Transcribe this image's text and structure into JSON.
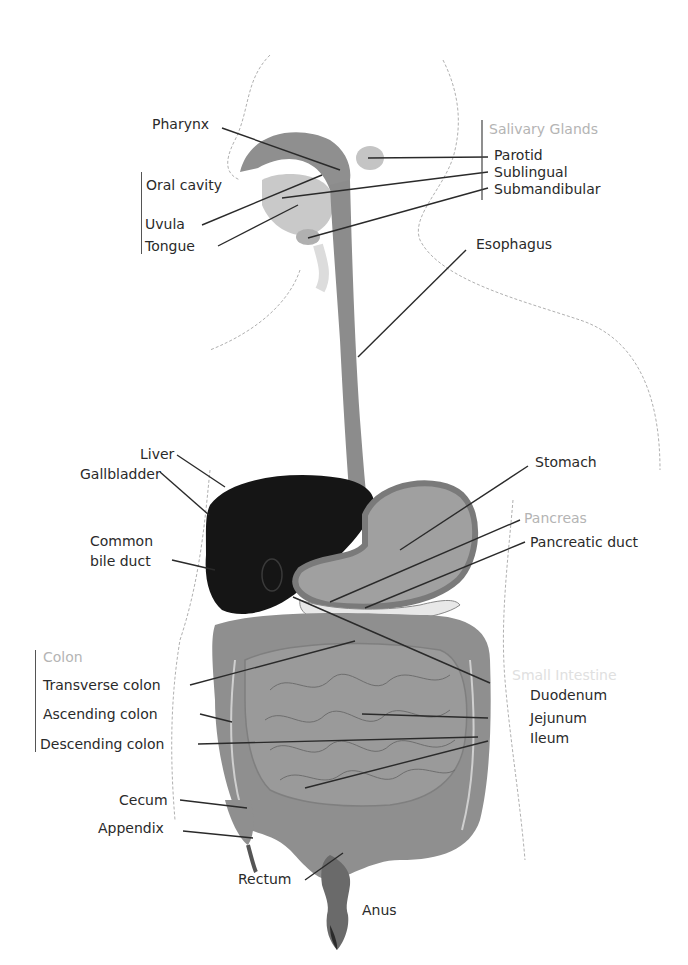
{
  "colors": {
    "organ_gray": "#8f8f8f",
    "organ_light": "#bdbdbd",
    "liver": "#141414",
    "outline": "#aaaaaa",
    "leader": "#2a2a2a",
    "label": "#2a2a2a",
    "group_label": "#b4b4b4"
  },
  "labels": {
    "pharynx": "Pharynx",
    "oral_cavity": "Oral cavity",
    "uvula": "Uvula",
    "tongue": "Tongue",
    "salivary_glands": "Salivary Glands",
    "parotid": "Parotid",
    "sublingual": "Sublingual",
    "submandibular": "Submandibular",
    "esophagus": "Esophagus",
    "liver": "Liver",
    "gallbladder": "Gallbladder",
    "stomach": "Stomach",
    "pancreas": "Pancreas",
    "pancreatic_duct": "Pancreatic duct",
    "common_bile_duct_line1": "Common",
    "common_bile_duct_line2": "bile duct",
    "colon": "Colon",
    "transverse_colon": "Transverse colon",
    "ascending_colon": "Ascending colon",
    "descending_colon": "Descending colon",
    "small_intestine": "Small Intestine",
    "duodenum": "Duodenum",
    "jejunum": "Jejunum",
    "ileum": "Ileum",
    "cecum": "Cecum",
    "appendix": "Appendix",
    "rectum": "Rectum",
    "anus": "Anus"
  }
}
